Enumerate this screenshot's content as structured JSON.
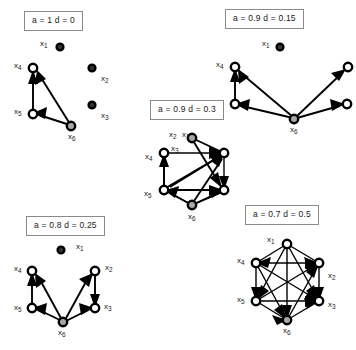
{
  "figure": {
    "background_color": "#ffffff",
    "width": 356,
    "height": 350,
    "node_count": 6,
    "node_ids": [
      "x1",
      "x2",
      "x3",
      "x4",
      "x5",
      "x6"
    ],
    "colors": {
      "edge": "#000000",
      "node_fill": "#ffffff",
      "node_stroke": "#000000",
      "source_node_fill": "#a8a8a8",
      "isolated_node_fill": "#3a3a3a",
      "label_box_border": "#8a8a8a",
      "text": "#1a1a1a"
    }
  },
  "panels": [
    {
      "id": "panel-a1-d0",
      "label": "a = 1 d = 0",
      "a": 1,
      "d": 0,
      "edge_count": 3,
      "node_labels": {
        "x1": "x",
        "x1sub": "1",
        "x2": "x",
        "x2sub": "2",
        "x3": "x",
        "x3sub": "3",
        "x4": "x",
        "x4sub": "4",
        "x5": "x",
        "x5sub": "5",
        "x6": "x",
        "x6sub": "6"
      },
      "edges": [
        "x5 -> x4",
        "x6 -> x4",
        "x6 -> x5"
      ],
      "isolated_nodes": [
        "x1",
        "x2",
        "x3"
      ]
    },
    {
      "id": "panel-a09-d015",
      "label": "a = 0.9 d = 0.15",
      "a": 0.9,
      "d": 0.15,
      "edge_count": 5,
      "edges": [
        "x5 -> x4",
        "x6 -> x4",
        "x6 -> x5",
        "x6 -> x2",
        "x6 -> x3"
      ],
      "isolated_nodes": [
        "x1"
      ]
    },
    {
      "id": "panel-a09-d03",
      "label": "a = 0.9 d = 0.3",
      "a": 0.9,
      "d": 0.3,
      "edge_count": 10,
      "edges": [
        "x1 -> x2",
        "x1 -> x3",
        "x4 -> x3",
        "x5 -> x4",
        "x5 -> x3",
        "x6 -> x5",
        "x6 -> x3",
        "x6 -> x2",
        "x4 -> x2",
        "x5 -> x2"
      ],
      "isolated_nodes": []
    },
    {
      "id": "panel-a08-d025",
      "label": "a = 0.8 d = 0.25",
      "a": 0.8,
      "d": 0.25,
      "edge_count": 6,
      "edges": [
        "x5 -> x4",
        "x6 -> x4",
        "x6 -> x5",
        "x6 -> x2",
        "x6 -> x3",
        "x2 -> x3"
      ],
      "isolated_nodes": [
        "x1"
      ]
    },
    {
      "id": "panel-a07-d05",
      "label": "a = 0.7 d = 0.5",
      "a": 0.7,
      "d": 0.5,
      "edge_count": 15,
      "edges": [
        "x1 -> x2",
        "x1 -> x3",
        "x1 -> x4",
        "x1 -> x5",
        "x1 -> x6",
        "x4 -> x2",
        "x4 -> x3",
        "x4 -> x5",
        "x4 -> x6",
        "x5 -> x2",
        "x5 -> x3",
        "x5 -> x6",
        "x6 -> x2",
        "x6 -> x3",
        "x2 -> x3"
      ],
      "isolated_nodes": []
    }
  ]
}
